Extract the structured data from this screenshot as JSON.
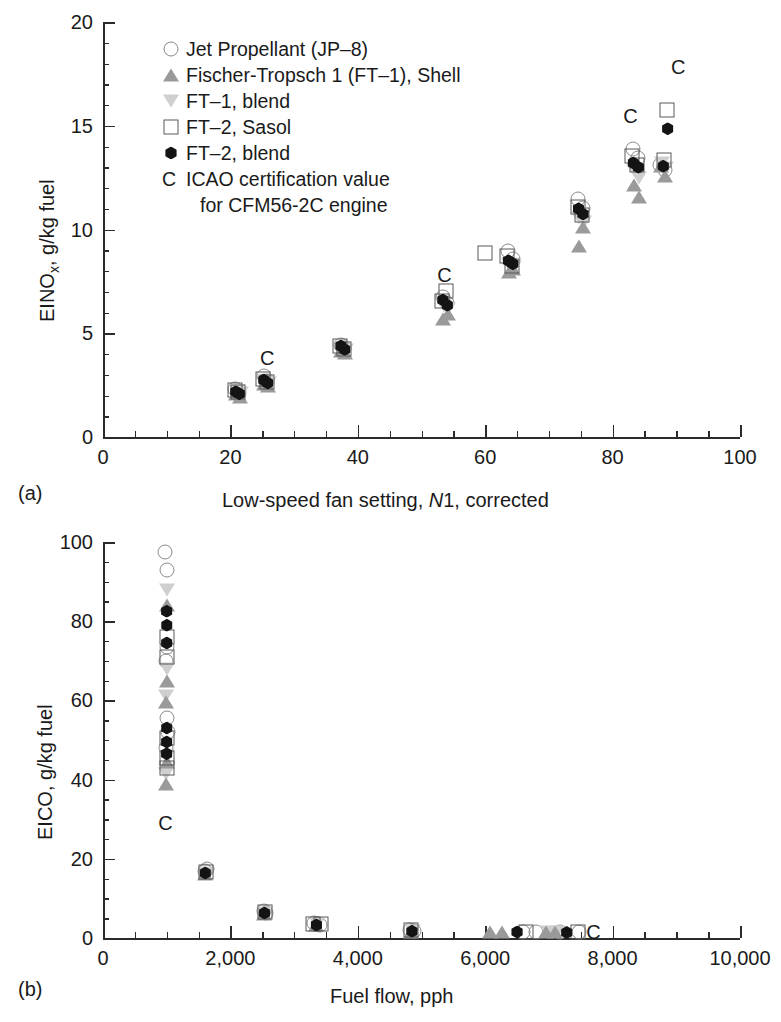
{
  "figure": {
    "panel_a_tag": "(a)",
    "panel_b_tag": "(b)"
  },
  "legend": {
    "entries": [
      {
        "symbol": "open-circle",
        "label": "Jet Propellant (JP–8)"
      },
      {
        "symbol": "filled-triangle-up",
        "label": "Fischer-Tropsch 1 (FT–1), Shell"
      },
      {
        "symbol": "filled-triangle-down",
        "label": "FT–1, blend"
      },
      {
        "symbol": "open-square",
        "label": "FT–2, Sasol"
      },
      {
        "symbol": "filled-hexagon",
        "label": "FT–2, blend"
      },
      {
        "symbol": "c-char",
        "label": "ICAO certification value",
        "char": "C"
      },
      {
        "symbol": "none",
        "label": "for CFM56-2C engine",
        "indent": true
      }
    ]
  },
  "chart_data": [
    {
      "id": "panel-a",
      "type": "scatter",
      "title": "",
      "xlabel_parts": [
        "Low-speed fan setting, ",
        "N",
        "1, corrected"
      ],
      "xlabel": "Low-speed fan setting, N1, corrected",
      "ylabel": "EINOx, g/kg fuel",
      "ylabel_parts": [
        "EINO",
        "x",
        ", g/kg fuel"
      ],
      "xlim": [
        0,
        100
      ],
      "ylim": [
        0,
        20
      ],
      "xticks": [
        0,
        20,
        40,
        60,
        80,
        100
      ],
      "xticklabels": [
        "0",
        "20",
        "40",
        "60",
        "80",
        "100"
      ],
      "yticks": [
        0,
        5,
        10,
        15,
        20
      ],
      "yticklabels": [
        "0",
        "5",
        "10",
        "15",
        "20"
      ],
      "x_minor_step": 5,
      "y_minor_step": 1,
      "grid": false,
      "legend_position": "upper-left",
      "series": [
        {
          "name": "Jet Propellant (JP–8)",
          "symbol": "open-circle",
          "points": [
            [
              20.8,
              2.3
            ],
            [
              21.3,
              2.12
            ],
            [
              25.2,
              2.95
            ],
            [
              25.8,
              2.7
            ],
            [
              37.3,
              4.45
            ],
            [
              37.9,
              4.28
            ],
            [
              53.3,
              6.75
            ],
            [
              54.0,
              6.45
            ],
            [
              63.6,
              8.95
            ],
            [
              64.3,
              8.6
            ],
            [
              74.6,
              11.45
            ],
            [
              75.3,
              11.05
            ],
            [
              83.2,
              13.9
            ],
            [
              84.0,
              13.45
            ],
            [
              87.5,
              13.1
            ],
            [
              88.2,
              12.85
            ]
          ]
        },
        {
          "name": "Fischer-Tropsch 1 (FT–1), Shell",
          "symbol": "filled-triangle-up",
          "points": [
            [
              20.9,
              2.05
            ],
            [
              21.5,
              1.95
            ],
            [
              25.3,
              2.55
            ],
            [
              25.9,
              2.45
            ],
            [
              37.4,
              4.15
            ],
            [
              38.0,
              4.05
            ],
            [
              53.4,
              5.7
            ],
            [
              54.1,
              5.95
            ],
            [
              63.7,
              7.95
            ],
            [
              64.4,
              8.1
            ],
            [
              74.7,
              9.2
            ],
            [
              75.4,
              10.1
            ],
            [
              83.3,
              12.15
            ],
            [
              84.1,
              11.55
            ],
            [
              87.6,
              13.05
            ],
            [
              88.3,
              12.6
            ]
          ]
        },
        {
          "name": "FT–1, blend",
          "symbol": "filled-triangle-down",
          "points": [
            [
              21.0,
              2.2
            ],
            [
              21.6,
              2.1
            ],
            [
              25.4,
              2.72
            ],
            [
              26.0,
              2.62
            ],
            [
              37.5,
              4.3
            ],
            [
              38.1,
              4.2
            ],
            [
              53.5,
              6.3
            ],
            [
              54.2,
              6.15
            ],
            [
              63.8,
              8.35
            ],
            [
              64.5,
              8.2
            ],
            [
              74.8,
              10.55
            ],
            [
              75.5,
              10.35
            ],
            [
              83.4,
              12.85
            ],
            [
              84.2,
              12.5
            ],
            [
              87.7,
              13.2
            ],
            [
              88.4,
              12.95
            ]
          ]
        },
        {
          "name": "FT–2, Sasol",
          "symbol": "open-square",
          "points": [
            [
              20.7,
              2.25
            ],
            [
              21.2,
              2.15
            ],
            [
              25.1,
              2.8
            ],
            [
              25.7,
              2.66
            ],
            [
              37.2,
              4.4
            ],
            [
              37.8,
              4.25
            ],
            [
              53.2,
              6.55
            ],
            [
              53.9,
              7.05
            ],
            [
              60.0,
              8.85
            ],
            [
              63.5,
              8.7
            ],
            [
              64.2,
              8.25
            ],
            [
              74.5,
              11.1
            ],
            [
              75.2,
              10.7
            ],
            [
              83.1,
              13.55
            ],
            [
              83.9,
              13.1
            ],
            [
              88.6,
              15.75
            ],
            [
              88.0,
              13.35
            ]
          ]
        },
        {
          "name": "FT–2, blend",
          "symbol": "filled-hexagon",
          "points": [
            [
              20.85,
              2.18
            ],
            [
              21.4,
              2.08
            ],
            [
              25.25,
              2.75
            ],
            [
              25.85,
              2.6
            ],
            [
              37.35,
              4.38
            ],
            [
              37.95,
              4.22
            ],
            [
              53.35,
              6.6
            ],
            [
              54.05,
              6.35
            ],
            [
              63.65,
              8.5
            ],
            [
              64.35,
              8.35
            ],
            [
              74.65,
              11.0
            ],
            [
              75.35,
              10.75
            ],
            [
              83.25,
              13.2
            ],
            [
              84.05,
              13.0
            ],
            [
              88.65,
              14.85
            ],
            [
              87.95,
              13.05
            ]
          ]
        }
      ],
      "annotations": [
        {
          "text": "C",
          "x": 25.8,
          "y": 3.8
        },
        {
          "text": "C",
          "x": 53.6,
          "y": 7.8
        },
        {
          "text": "C",
          "x": 82.8,
          "y": 15.45
        },
        {
          "text": "C",
          "x": 90.3,
          "y": 17.85
        }
      ]
    },
    {
      "id": "panel-b",
      "type": "scatter",
      "title": "",
      "xlabel": "Fuel flow, pph",
      "ylabel": "EICO, g/kg fuel",
      "xlim": [
        0,
        10000
      ],
      "ylim": [
        0,
        100
      ],
      "xticks": [
        0,
        2000,
        4000,
        6000,
        8000,
        10000
      ],
      "xticklabels": [
        "0",
        "2,000",
        "4,000",
        "6,000",
        "8,000",
        "10,000"
      ],
      "yticks": [
        0,
        20,
        40,
        60,
        80,
        100
      ],
      "yticklabels": [
        "0",
        "20",
        "40",
        "60",
        "80",
        "100"
      ],
      "x_minor_step": 500,
      "y_minor_step": 5,
      "grid": false,
      "legend_position": "none",
      "series": [
        {
          "name": "Jet Propellant (JP–8)",
          "symbol": "open-circle",
          "points": [
            [
              980,
              97.5
            ],
            [
              1000,
              93.0
            ],
            [
              1010,
              73.5
            ],
            [
              995,
              70.0
            ],
            [
              1005,
              55.5
            ],
            [
              1015,
              52.0
            ],
            [
              990,
              48.0
            ],
            [
              1600,
              16.8
            ],
            [
              1640,
              17.4
            ],
            [
              2520,
              6.9
            ],
            [
              2560,
              6.2
            ],
            [
              3320,
              3.9
            ],
            [
              3400,
              3.4
            ],
            [
              4820,
              2.0
            ],
            [
              4880,
              1.7
            ],
            [
              6600,
              1.6
            ],
            [
              6800,
              1.5
            ],
            [
              7180,
              1.5
            ],
            [
              7480,
              1.4
            ]
          ]
        },
        {
          "name": "Fischer-Tropsch 1 (FT–1), Shell",
          "symbol": "filled-triangle-up",
          "points": [
            [
              1000,
              84.0
            ],
            [
              1005,
              65.0
            ],
            [
              995,
              59.5
            ],
            [
              1010,
              44.5
            ],
            [
              990,
              39.0
            ],
            [
              1600,
              16.2
            ],
            [
              2530,
              6.0
            ],
            [
              3340,
              3.2
            ],
            [
              4840,
              1.6
            ],
            [
              6080,
              1.5
            ],
            [
              6260,
              1.5
            ],
            [
              6960,
              1.4
            ],
            [
              7100,
              1.4
            ]
          ]
        },
        {
          "name": "FT–1, blend",
          "symbol": "filled-triangle-down",
          "points": [
            [
              1000,
              88.0
            ],
            [
              1008,
              68.0
            ],
            [
              996,
              61.0
            ],
            [
              1012,
              46.0
            ],
            [
              992,
              41.5
            ],
            [
              1620,
              16.5
            ],
            [
              2540,
              6.4
            ],
            [
              3360,
              3.5
            ],
            [
              4860,
              1.8
            ],
            [
              6980,
              1.5
            ],
            [
              7120,
              1.4
            ]
          ]
        },
        {
          "name": "FT–2, Sasol",
          "symbol": "open-square",
          "points": [
            [
              1000,
              76.0
            ],
            [
              1006,
              71.0
            ],
            [
              1002,
              50.5
            ],
            [
              998,
              45.5
            ],
            [
              1004,
              43.0
            ],
            [
              1610,
              16.6
            ],
            [
              2545,
              6.5
            ],
            [
              3300,
              3.6
            ],
            [
              3430,
              3.5
            ],
            [
              4830,
              1.9
            ],
            [
              6640,
              1.5
            ],
            [
              7460,
              1.4
            ]
          ]
        },
        {
          "name": "FT–2, blend",
          "symbol": "filled-hexagon",
          "points": [
            [
              1000,
              82.5
            ],
            [
              1003,
              79.0
            ],
            [
              1001,
              74.5
            ],
            [
              1002,
              53.0
            ],
            [
              1000,
              49.5
            ],
            [
              999,
              46.5
            ],
            [
              1605,
              16.4
            ],
            [
              2535,
              6.3
            ],
            [
              3350,
              3.3
            ],
            [
              4850,
              1.7
            ],
            [
              6500,
              1.5
            ],
            [
              7280,
              1.4
            ]
          ]
        }
      ],
      "annotations": [
        {
          "text": "C",
          "x": 980,
          "y": 29.0
        },
        {
          "text": "C",
          "x": 7700,
          "y": 1.6
        }
      ]
    }
  ],
  "colors": {
    "axis": "#2b2b2b",
    "text": "#1a1a1a",
    "open_circle": "#8a8a8a",
    "open_square": "#585858",
    "triangle_up": "#9a9a9a",
    "triangle_down": "#cfcfcf",
    "hexagon": "#141414"
  }
}
